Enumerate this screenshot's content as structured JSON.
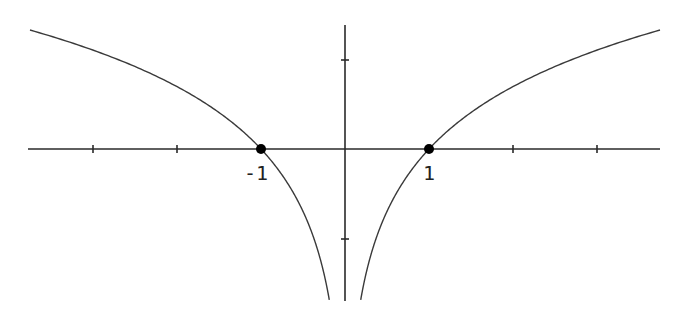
{
  "chart_data": {
    "type": "line",
    "title": "",
    "function": "y = ln|x|",
    "xlabel": "",
    "ylabel": "",
    "xlim": [
      -3.75,
      3.75
    ],
    "ylim": [
      -1.7,
      1.35
    ],
    "x_ticks": [
      -3,
      -2,
      -1,
      1,
      2,
      3
    ],
    "y_ticks": [
      -1,
      1
    ],
    "tick_labels": [
      {
        "x": -1,
        "label": "-1"
      },
      {
        "x": 1,
        "label": "1"
      }
    ],
    "grid": false,
    "legend": null,
    "series": [
      {
        "name": "ln|x| (x<0)",
        "x": [
          -3.75,
          -3,
          -2,
          -1.5,
          -1,
          -0.75,
          -0.5,
          -0.35,
          -0.25,
          -0.19
        ],
        "values": [
          1.32,
          1.1,
          0.69,
          0.41,
          0,
          -0.29,
          -0.69,
          -1.05,
          -1.39,
          -1.66
        ]
      },
      {
        "name": "ln|x| (x>0)",
        "x": [
          0.19,
          0.25,
          0.35,
          0.5,
          0.75,
          1,
          1.5,
          2,
          3,
          3.75
        ],
        "values": [
          -1.66,
          -1.39,
          -1.05,
          -0.69,
          -0.29,
          0,
          0.41,
          0.69,
          1.1,
          1.32
        ]
      }
    ],
    "annotations": [
      {
        "type": "point",
        "x": -1,
        "y": 0,
        "label": "-1"
      },
      {
        "type": "point",
        "x": 1,
        "y": 0,
        "label": "1"
      }
    ]
  },
  "labels": {
    "neg_one": "-1",
    "pos_one": "1"
  },
  "style": {
    "axis_color": "#2a2a2a",
    "curve_color": "#3a3a3a",
    "point_color": "#000000",
    "background": "#ffffff"
  }
}
